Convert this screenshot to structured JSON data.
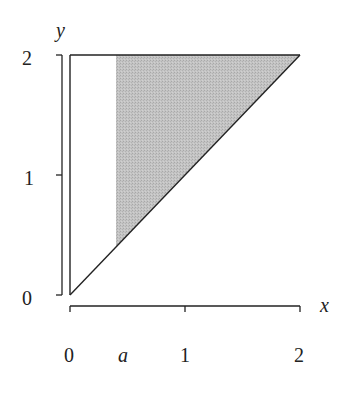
{
  "figure": {
    "axes": {
      "x_label": "x",
      "y_label": "y",
      "x_ticks": [
        {
          "value": 0,
          "label": "0"
        },
        {
          "value": 0.4,
          "label": "a"
        },
        {
          "value": 1,
          "label": "1"
        },
        {
          "value": 2,
          "label": "2"
        }
      ],
      "y_ticks": [
        {
          "value": 0,
          "label": "0"
        },
        {
          "value": 1,
          "label": "1"
        },
        {
          "value": 2,
          "label": "2"
        }
      ],
      "xlim": [
        0,
        2
      ],
      "ylim": [
        0,
        2
      ]
    },
    "region": {
      "description": "Triangle with vertices (0,0), (0,2), (2,2); shaded part where x >= a",
      "outline_vertices": [
        [
          0,
          0
        ],
        [
          0,
          2
        ],
        [
          2,
          2
        ]
      ],
      "shaded_vertices": [
        [
          0.4,
          0.4
        ],
        [
          0.4,
          2
        ],
        [
          2,
          2
        ]
      ],
      "shade_color": "#bdbdbd",
      "line_color": "#222222"
    }
  }
}
